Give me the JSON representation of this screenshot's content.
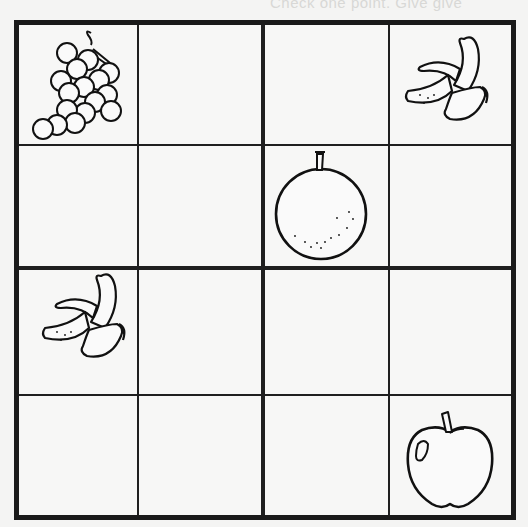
{
  "header": {
    "faded_text": "Check one point. Give give"
  },
  "puzzle": {
    "type": "4x4 fruit sudoku",
    "size": 4,
    "fruits": [
      "grapes",
      "banana",
      "orange",
      "apple"
    ],
    "grid": [
      [
        "grapes",
        "",
        "",
        "banana"
      ],
      [
        "",
        "",
        "orange",
        ""
      ],
      [
        "banana",
        "",
        "",
        ""
      ],
      [
        "",
        "",
        "",
        "apple"
      ]
    ],
    "colors": {
      "line": "#1a1a1a",
      "paper": "#f7f7f6"
    }
  }
}
